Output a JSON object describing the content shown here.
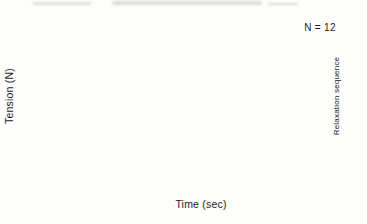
{
  "chart_data": {
    "type": "line",
    "title": "",
    "annotation": "N = 12",
    "xlabel": "Time (sec)",
    "ylabel": "Tension (N)",
    "right_label": "Relaxation sequence",
    "x": [
      0,
      3,
      6,
      12,
      18,
      24,
      30
    ],
    "xlim": [
      0,
      35
    ],
    "ylim": [
      60,
      80
    ],
    "y_axis_break": true,
    "x_ticks": [
      0,
      5,
      10,
      15,
      20,
      25,
      30,
      35
    ],
    "y_ticks": [
      80,
      75,
      70,
      65,
      60
    ],
    "marker": "square",
    "line_color": "#2a2a2a",
    "legend_position": "right-edge-labels",
    "grid": false,
    "series": [
      {
        "name": "relaxation-seq-5-10-upper",
        "label": "5–10",
        "values": [
          78.4,
          76.2,
          75.5,
          74.6,
          74.0,
          73.6,
          72.8
        ]
      },
      {
        "name": "relaxation-seq-5-10-mid",
        "label": "",
        "values": [
          78.4,
          76.0,
          75.3,
          74.3,
          73.7,
          73.3,
          72.5
        ]
      },
      {
        "name": "relaxation-seq-5-10-lower",
        "label": "",
        "values": [
          78.4,
          75.8,
          75.1,
          74.0,
          73.4,
          73.0,
          72.2
        ]
      },
      {
        "name": "relaxation-seq-4",
        "label": "4",
        "values": [
          78.4,
          75.6,
          74.8,
          73.7,
          73.0,
          72.6,
          71.9
        ]
      },
      {
        "name": "relaxation-seq-3",
        "label": "3",
        "values": [
          78.4,
          75.4,
          74.5,
          73.3,
          72.5,
          72.1,
          71.4
        ]
      },
      {
        "name": "relaxation-seq-2",
        "label": "2",
        "values": [
          78.4,
          75.1,
          74.2,
          72.6,
          71.2,
          70.5,
          70.0
        ]
      },
      {
        "name": "relaxation-seq-1",
        "label": "1",
        "values": [
          78.4,
          74.5,
          72.6,
          70.4,
          68.5,
          67.8,
          67.3
        ]
      }
    ]
  }
}
